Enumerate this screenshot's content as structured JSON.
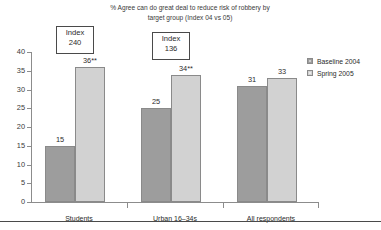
{
  "chart_data": {
    "type": "bar",
    "title": "% Agree can do great deal to reduce risk of robbery by target group (Index 04 vs 05)",
    "title_line1": "% Agree can do great deal to reduce risk of robbery by",
    "title_line2": "target group (Index 04 vs 05)",
    "xlabel": "",
    "ylabel": "",
    "ylim": [
      0,
      40
    ],
    "ytick_step": 5,
    "grid": false,
    "legend_position": "right",
    "categories": [
      "Students",
      "Urban 16–34s",
      "All respondents"
    ],
    "series": [
      {
        "name": "Baseline 2004",
        "color": "#9d9d9d",
        "values": [
          15,
          25,
          31
        ],
        "labels": [
          "15",
          "25",
          "31"
        ]
      },
      {
        "name": "Spring 2005",
        "color": "#d2d2d2",
        "values": [
          36,
          34,
          33
        ],
        "labels": [
          "36**",
          "34**",
          "33"
        ]
      }
    ],
    "yticks": [
      "0",
      "5",
      "10",
      "15",
      "20",
      "25",
      "30",
      "35",
      "40"
    ],
    "annotations": [
      {
        "word": "Index",
        "value": "240",
        "category": "Students"
      },
      {
        "word": "Index",
        "value": "136",
        "category": "Urban 16–34s"
      }
    ]
  },
  "legend": {
    "items": [
      {
        "label": "Baseline 2004"
      },
      {
        "label": "Spring 2005"
      }
    ]
  }
}
